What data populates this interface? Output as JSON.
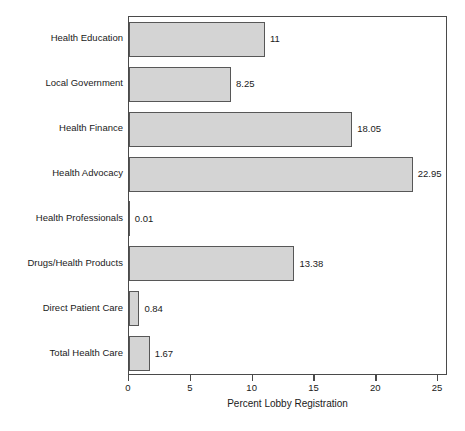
{
  "chart_data": {
    "type": "bar",
    "orientation": "horizontal",
    "title": "",
    "subtitle": "",
    "xlabel": "Percent Lobby Registration",
    "ylabel": "",
    "xlim": [
      0,
      25.8
    ],
    "xticks": [
      0,
      5,
      10,
      15,
      20,
      25
    ],
    "xtick_labels": [
      "0",
      "5",
      "10",
      "15",
      "20",
      "25"
    ],
    "grid": false,
    "legend": null,
    "categories": [
      "Health Education",
      "Local Government",
      "Health Finance",
      "Health Advocacy",
      "Health Professionals",
      "Drugs/Health Products",
      "Direct Patient Care",
      "Total Health Care"
    ],
    "values": [
      11,
      8.25,
      18.05,
      22.95,
      0.01,
      13.38,
      0.84,
      1.67
    ],
    "value_labels": [
      "11",
      "8.25",
      "18.05",
      "22.95",
      "0.01",
      "13.38",
      "0.84",
      "1.67"
    ],
    "bar_fill_color": "#d4d4d4",
    "bar_border_color": "#575757",
    "axis_color": "#4a4a4a",
    "text_color": "#1a1a1a",
    "background_color": "#ffffff"
  }
}
